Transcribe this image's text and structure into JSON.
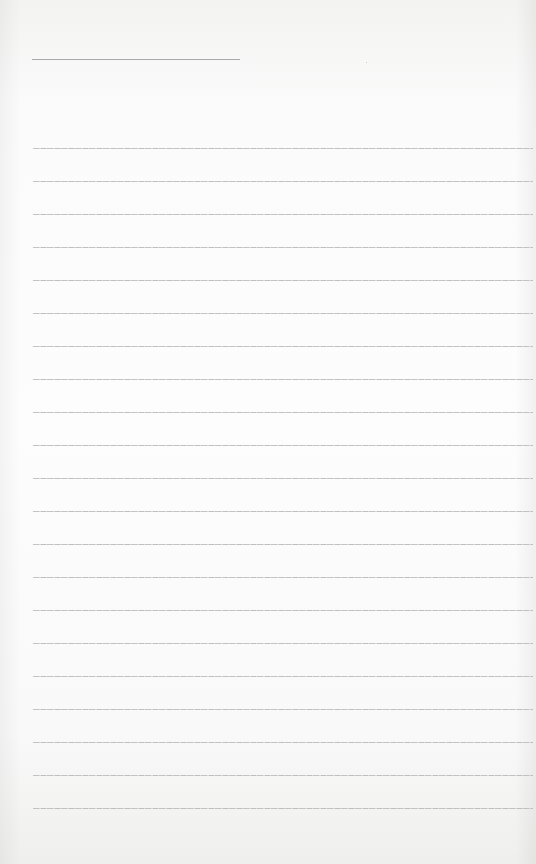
{
  "page": {
    "type": "blank-lined-paper",
    "header_line": {
      "left": 32,
      "top": 59,
      "width": 208
    },
    "rules": {
      "count": 21,
      "first_top": 148,
      "spacing": 33,
      "left": 33,
      "right_inset": 3
    },
    "colors": {
      "paper": "#fdfdfd",
      "rule": "#bdbdbd",
      "header_line": "#a9a9a9"
    }
  }
}
